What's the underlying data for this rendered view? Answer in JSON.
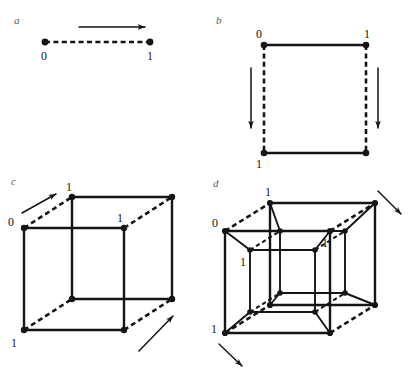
{
  "figure": {
    "background_color": "#ffffff",
    "ink_color": "#151515",
    "panel_letter_color": "#5a5a5a",
    "width": 413,
    "height": 373
  },
  "panels": [
    {
      "id": "a",
      "letter": "a",
      "name": "segment-1-cube",
      "description": "Dashed line segment with two endpoint vertices and a rightward translation arrow",
      "vertex_labels": [
        "0",
        "1"
      ],
      "arrow_count": 1,
      "arrow_direction": "right"
    },
    {
      "id": "b",
      "letter": "b",
      "name": "square-2-cube",
      "description": "Square formed by translating the segment downward; solid horizontal edges, dashed vertical edges",
      "vertex_labels": [
        "0",
        "1",
        "1"
      ],
      "arrow_count": 2,
      "arrow_direction": "down"
    },
    {
      "id": "c",
      "letter": "c",
      "name": "cube-3-cube",
      "description": "Cube formed by translating the square back and up-right; dashed depth edges",
      "vertex_labels": [
        "0",
        "1",
        "1",
        "1"
      ],
      "arrow_count": 2,
      "arrow_direction": "up-right"
    },
    {
      "id": "d",
      "letter": "d",
      "name": "tesseract-4-cube",
      "description": "Tesseract formed by translating the cube; outer cube with nested inner cube joined by connecting edges",
      "vertex_labels": [
        "1",
        "0",
        "1",
        "1",
        "1"
      ],
      "arrow_count": 2,
      "arrow_direction": "down-right"
    }
  ],
  "labels": {
    "panel_a": {
      "letter": "a",
      "zero": "0",
      "one": "1"
    },
    "panel_b": {
      "letter": "b",
      "top_left": "0",
      "top_right": "1",
      "bottom_left": "1"
    },
    "panel_c": {
      "letter": "c",
      "front_top_left": "0",
      "back_top_left": "1",
      "front_top_right": "1",
      "front_bottom_left": "1"
    },
    "panel_d": {
      "letter": "d",
      "outer_back_top_left": "1",
      "outer_front_top_left": "0",
      "inner_front_top_left": "1",
      "inner_back_top_right": "1",
      "outer_front_bottom_left": "1"
    }
  }
}
